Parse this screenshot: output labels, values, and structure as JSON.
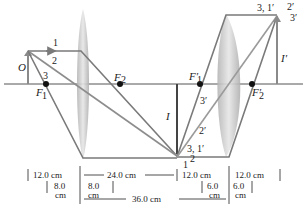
{
  "diagram": {
    "type": "two-lens ray diagram",
    "colors": {
      "axis": "#555555",
      "ray": "#7a7a7a",
      "object": "#8a8a8a",
      "lens": "#c8c8c8",
      "focal_point": "#111111",
      "text": "#222222"
    },
    "labels": {
      "object": "O",
      "intermediate_image": "I",
      "final_image": "I′",
      "f1": "F",
      "f1_sub": "1",
      "f2": "F",
      "f2_sub": "2",
      "f1p": "F′",
      "f1p_sub": "1",
      "f2p": "F′",
      "f2p_sub": "2",
      "ray1": "1",
      "ray2": "2",
      "ray3": "3",
      "ray_bottom_31": "3, 1′",
      "ray_bottom_2": "2",
      "ray_bottom_1": "1",
      "ray_2p": "2′",
      "ray_3p_mid": "3′",
      "ray_top_31": "3, 1′",
      "ray_top_2p": "2′",
      "ray_top_3p": "3′"
    },
    "dimensions": {
      "obj_to_lens1": "12.0 cm",
      "f1_left": "8.0",
      "f1_left_unit": "cm",
      "f1_right": "8.0",
      "f1_right_unit": "cm",
      "lens1_to_image": "24.0 cm",
      "image_to_lens2": "12.0 cm",
      "lens2_to_final": "12.0 cm",
      "f2_left": "6.0",
      "f2_left_unit": "cm",
      "f2_right": "6.0",
      "f2_right_unit": "cm",
      "lens_separation": "36.0 cm"
    }
  }
}
